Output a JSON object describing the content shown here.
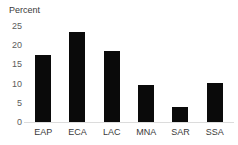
{
  "chart_data": {
    "type": "bar",
    "title": "",
    "subtitle": "",
    "xlabel": "",
    "ylabel": "Percent",
    "categories": [
      "EAP",
      "ECA",
      "LAC",
      "MNA",
      "SAR",
      "SSA"
    ],
    "values": [
      17.5,
      23.5,
      18.5,
      9.6,
      3.9,
      10.1
    ],
    "ylim": [
      0,
      25
    ],
    "ytick_labels": [
      "0",
      "5",
      "10",
      "15",
      "20",
      "25"
    ],
    "ytick_values": [
      0,
      5,
      10,
      15,
      20,
      25
    ],
    "grid": false,
    "legend": false,
    "legend_position": "none",
    "bar_color": "#0a0a0a",
    "background_color": "#ffffff",
    "baseline_color": "#dcdcdc",
    "tick_label_color": "#5c5c5c",
    "axis_title_color": "#3a3a3a"
  }
}
